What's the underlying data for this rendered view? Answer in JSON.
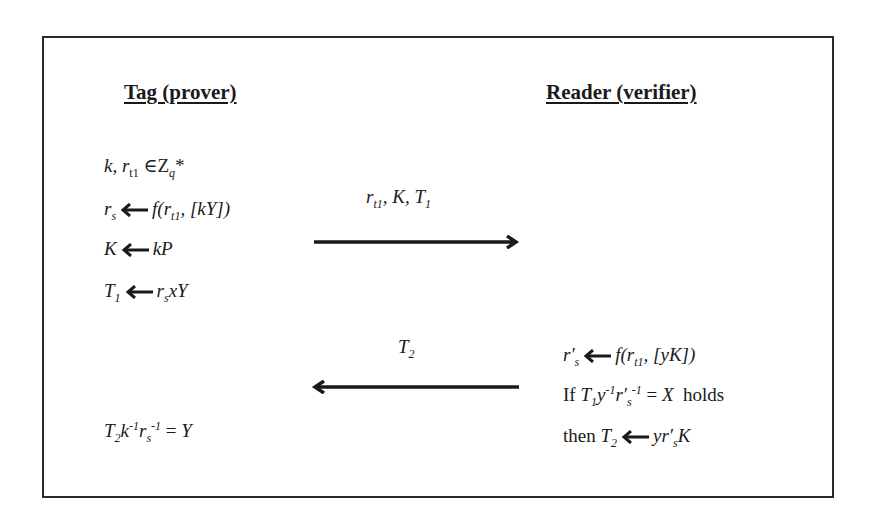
{
  "diagram": {
    "type": "protocol-sequence",
    "parties": {
      "left": {
        "heading": "Tag (prover)"
      },
      "right": {
        "heading": "Reader (verifier)"
      }
    },
    "left_steps": [
      {
        "id": "init",
        "text": "k, r_t1 ∈ Z_q*"
      },
      {
        "id": "rs",
        "text": "r_s ← f(r_t1, [kY])"
      },
      {
        "id": "K",
        "text": "K ← kP"
      },
      {
        "id": "T1",
        "text": "T_1 ← r_s x Y"
      },
      {
        "id": "verify",
        "text": "T_2 k^-1 r_s^-1 = Y"
      }
    ],
    "right_steps": [
      {
        "id": "rs_prime",
        "text": "r′_s ← f(r_t1, [yK])"
      },
      {
        "id": "check",
        "text": "If T_1 y^-1 r′_s^-1 = X holds"
      },
      {
        "id": "T2",
        "text": "then T_2 ← y r′_s K"
      }
    ],
    "messages": [
      {
        "direction": "left-to-right",
        "label": "r_t1, K, T_1"
      },
      {
        "direction": "right-to-left",
        "label": "T_2"
      }
    ],
    "labels": {
      "if_word": "If",
      "holds_word": "holds",
      "then_word": "then",
      "elem_of": "∈",
      "Z": "Z",
      "q": "q",
      "star": "*"
    },
    "colors": {
      "stroke": "#1a1a1a",
      "frame": "#2a2a2a",
      "background": "#ffffff"
    }
  }
}
